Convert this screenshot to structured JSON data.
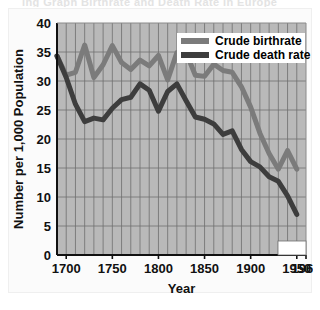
{
  "figure": {
    "top_ghost_caption": "ing Graph  Birthrate and Death Rate in Europe",
    "background_color": "#fbfbfb",
    "plot_background_color": "#b9b9b9",
    "grid_color": "#6f6f6f",
    "axis_color": "#111111"
  },
  "chart_data": {
    "type": "line",
    "title": "",
    "xlabel": "Year",
    "ylabel": "Number per 1,000 Population",
    "xlim": [
      1690,
      1960
    ],
    "ylim": [
      0,
      40
    ],
    "ytick_step": 5,
    "xtick_step": 50,
    "x_minor_step": 10,
    "y_minor_step": 5,
    "grid": true,
    "legend_position": "top-right",
    "yticks": [
      0,
      5,
      10,
      15,
      20,
      25,
      30,
      35,
      40
    ],
    "ytick_labels": [
      "0",
      "5",
      "10",
      "15",
      "20",
      "25",
      "30",
      "35",
      "40"
    ],
    "xticks": [
      1700,
      1750,
      1800,
      1850,
      1900,
      1950,
      1960
    ],
    "xtick_labels": [
      "1700",
      "1750",
      "1800",
      "1850",
      "1900",
      "1950",
      "1960"
    ],
    "series": [
      {
        "name": "Crude birthrate",
        "color": "#7b7b7b",
        "linewidth": 5,
        "x": [
          1690,
          1700,
          1710,
          1720,
          1730,
          1740,
          1750,
          1760,
          1770,
          1780,
          1790,
          1800,
          1810,
          1820,
          1830,
          1840,
          1850,
          1860,
          1870,
          1880,
          1890,
          1900,
          1910,
          1920,
          1930,
          1940,
          1950
        ],
        "y": [
          34.3,
          31.0,
          31.5,
          36.2,
          30.6,
          32.8,
          36.1,
          33.2,
          32.0,
          33.6,
          32.6,
          34.4,
          30.2,
          34.9,
          34.9,
          31.0,
          30.8,
          32.9,
          31.8,
          31.5,
          29.0,
          25.5,
          21.0,
          17.5,
          14.8,
          18.0,
          14.8
        ]
      },
      {
        "name": "Crude death rate",
        "color": "#3d3d3d",
        "linewidth": 5,
        "x": [
          1690,
          1700,
          1710,
          1720,
          1730,
          1740,
          1750,
          1760,
          1770,
          1780,
          1790,
          1800,
          1810,
          1820,
          1830,
          1840,
          1850,
          1860,
          1870,
          1880,
          1890,
          1900,
          1910,
          1920,
          1930,
          1940,
          1950
        ],
        "y": [
          34.3,
          30.6,
          26.0,
          23.0,
          23.6,
          23.3,
          25.3,
          26.8,
          27.2,
          29.5,
          28.4,
          24.8,
          28.2,
          29.5,
          26.6,
          23.8,
          23.4,
          22.6,
          20.8,
          21.4,
          18.2,
          16.1,
          15.2,
          13.5,
          12.7,
          10.2,
          7.0
        ]
      }
    ],
    "legend": [
      {
        "label": "Crude birthrate",
        "color": "#7b7b7b"
      },
      {
        "label": "Crude death rate",
        "color": "#3d3d3d"
      }
    ]
  }
}
